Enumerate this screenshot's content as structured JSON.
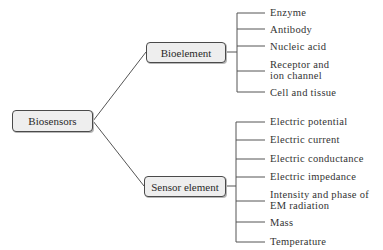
{
  "root": {
    "label": "Biosensors"
  },
  "branches": [
    {
      "label": "Bioelement",
      "children": [
        "Enzyme",
        "Antibody",
        "Nucleic acid",
        "Receptor and\nion channel",
        "Cell and tissue"
      ]
    },
    {
      "label": "Sensor element",
      "children": [
        "Electric potential",
        "Electric current",
        "Electric conductance",
        "Electric impedance",
        "Intensity and phase of\nEM radiation",
        "Mass",
        "Temperature"
      ]
    }
  ],
  "colors": {
    "line": "#555555",
    "node_fill": "#eeeeee",
    "node_border": "#4a4a4a"
  }
}
